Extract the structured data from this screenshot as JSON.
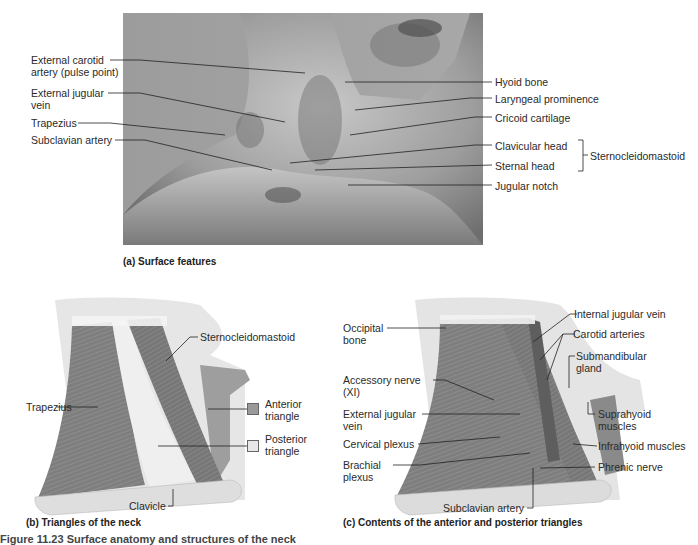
{
  "panel_a": {
    "caption": "(a) Surface features",
    "left_labels": [
      {
        "text": "External carotid\nartery (pulse point)",
        "line1": "External carotid",
        "line2": "artery (pulse point)"
      },
      {
        "text": "External jugular vein",
        "line1": "External jugular",
        "line2": "vein"
      },
      {
        "text": "Trapezius",
        "line1": "Trapezius"
      },
      {
        "text": "Subclavian artery",
        "line1": "Subclavian artery"
      }
    ],
    "right_labels": [
      "Hyoid bone",
      "Laryngeal prominence",
      "Cricoid cartilage",
      "Clavicular head",
      "Sternal head",
      "Jugular notch"
    ],
    "bracket_label": "Sternocleidomastoid"
  },
  "panel_b": {
    "caption": "(b) Triangles of the neck",
    "labels": {
      "sternocleidomastoid": "Sternocleidomastoid",
      "trapezius": "Trapezius",
      "clavicle": "Clavicle"
    },
    "legend": [
      {
        "line1": "Anterior",
        "line2": "triangle",
        "color": "#9a9a9a"
      },
      {
        "line1": "Posterior",
        "line2": "triangle",
        "color": "#e8e8e8"
      }
    ]
  },
  "panel_c": {
    "caption": "(c) Contents of the anterior and posterior triangles",
    "left_labels": [
      {
        "line1": "Occipital",
        "line2": "bone"
      },
      {
        "line1": "Accessory nerve",
        "line2": "(XI)"
      },
      {
        "line1": "External jugular",
        "line2": "vein"
      },
      {
        "line1": "Cervical plexus"
      },
      {
        "line1": "Brachial",
        "line2": "plexus"
      }
    ],
    "right_labels": [
      {
        "line1": "Internal jugular vein"
      },
      {
        "line1": "Carotid arteries"
      },
      {
        "line1": "Submandibular",
        "line2": "gland"
      },
      {
        "line1": "Suprahyoid",
        "line2": "muscles"
      },
      {
        "line1": "Infrahyoid muscles"
      },
      {
        "line1": "Phrenic nerve"
      }
    ],
    "bottom_label": "Subclavian artery"
  },
  "figure_caption": "Figure 11.23 Surface anatomy and structures of the neck"
}
